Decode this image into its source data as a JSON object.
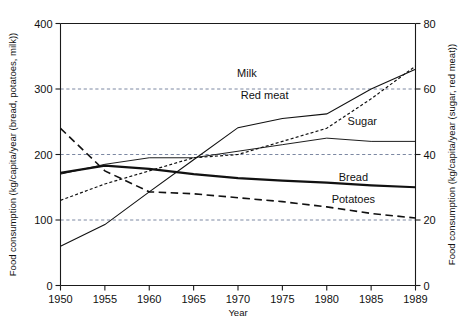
{
  "chart_data": {
    "type": "line",
    "title": "",
    "xlabel": "Year",
    "ylabel": "Food consumption (kg/capita/year (bread, potatoes, milk))",
    "y2label": "Food consumption (kg/capita/year (sugar, red meat))",
    "x": [
      1950,
      1955,
      1960,
      1965,
      1970,
      1975,
      1980,
      1985,
      1989
    ],
    "xticklabels": [
      "1950",
      "1955",
      "1960",
      "1965",
      "1970",
      "1975",
      "1980",
      "1985",
      "1989"
    ],
    "xlim": [
      1950,
      1989
    ],
    "ylim": [
      0,
      400
    ],
    "yticks": [
      0,
      100,
      200,
      300,
      400
    ],
    "yticklabels": [
      "0",
      "100",
      "200",
      "300",
      "400"
    ],
    "y2lim": [
      0,
      80
    ],
    "y2ticks": [
      0,
      20,
      40,
      60,
      80
    ],
    "y2ticklabels": [
      "0",
      "20",
      "40",
      "60",
      "80"
    ],
    "grid": "horizontal dashed at 100, 200, 300 (left) / 20, 40, 60 (right)",
    "legend_position": "inline labels on curves",
    "series": [
      {
        "name": "Milk",
        "axis": "left",
        "style": "thin solid",
        "values": [
          60,
          93,
          143,
          192,
          241,
          255,
          262,
          300,
          330
        ],
        "label_x": 1971,
        "label_y": 318
      },
      {
        "name": "Red meat",
        "axis": "right",
        "style": "dotted",
        "values": [
          26,
          31,
          35,
          39,
          40,
          44,
          48,
          57,
          67
        ],
        "label_x": 1973,
        "label_y": 57
      },
      {
        "name": "Sugar",
        "axis": "right",
        "style": "thin solid",
        "values": [
          34,
          37,
          39,
          39,
          41,
          43,
          45,
          44,
          44
        ],
        "label_x": 1984,
        "label_y": 49
      },
      {
        "name": "Bread",
        "axis": "left",
        "style": "thick solid",
        "values": [
          172,
          183,
          178,
          170,
          164,
          160,
          157,
          153,
          150
        ],
        "label_x": 1983,
        "label_y": 160
      },
      {
        "name": "Potatoes",
        "axis": "left",
        "style": "long dashed",
        "values": [
          240,
          175,
          143,
          140,
          134,
          128,
          120,
          110,
          103
        ],
        "label_x": 1983,
        "label_y": 126
      }
    ],
    "colors": {
      "line": "#111111",
      "grid": "#5a6a8a",
      "axis": "#1a1a1a",
      "background": "#ffffff"
    }
  }
}
